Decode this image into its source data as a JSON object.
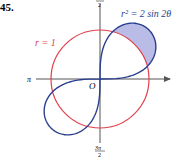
{
  "problem_number": "45.",
  "labels": {
    "circle": "r = 1",
    "curve": "r² = 2 sin 2θ",
    "origin": "O",
    "pi": "π",
    "top_num": "π",
    "top_den": "2",
    "bottom_num": "3π",
    "bottom_den": "2"
  },
  "colors": {
    "circle": "#e0404a",
    "curve": "#2b3f8f",
    "shade": "#b9bce6",
    "axis": "#555555"
  },
  "diagram": {
    "circle_radius": 1,
    "lemniscate_a2": 2
  }
}
